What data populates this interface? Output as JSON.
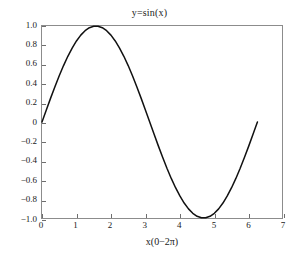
{
  "chart_data": {
    "type": "line",
    "title": "y=sin(x)",
    "xlabel": "x(0−2π)",
    "ylabel": "",
    "xlim": [
      0,
      7
    ],
    "ylim": [
      -1.0,
      1.0
    ],
    "grid": false,
    "legend": false,
    "line_color": "#111111",
    "frame_color": "#8c8c8c",
    "xticks": [
      0,
      1,
      2,
      3,
      4,
      5,
      6,
      7
    ],
    "xtick_labels": [
      "0",
      "1",
      "2",
      "3",
      "4",
      "5",
      "6",
      "7"
    ],
    "yticks": [
      1.0,
      0.8,
      0.6,
      0.4,
      0.2,
      0,
      -0.2,
      -0.4,
      -0.6,
      -0.8,
      -1.0
    ],
    "ytick_labels": [
      "1.0",
      "0.8",
      "0.6",
      "0.4",
      "0.2",
      "0",
      "−0.2",
      "−0.4",
      "−0.6",
      "−0.8",
      "−1.0"
    ],
    "series": [
      {
        "name": "sin(x)",
        "x": [
          0.0,
          0.1257,
          0.2513,
          0.377,
          0.5027,
          0.6283,
          0.754,
          0.8796,
          1.0053,
          1.131,
          1.2566,
          1.3823,
          1.508,
          1.6336,
          1.7593,
          1.885,
          2.0106,
          2.1363,
          2.2619,
          2.3876,
          2.5133,
          2.6389,
          2.7646,
          2.8903,
          3.0159,
          3.1416,
          3.2673,
          3.3929,
          3.5186,
          3.6442,
          3.7699,
          3.8956,
          4.0212,
          4.1469,
          4.2726,
          4.3982,
          4.5239,
          4.6496,
          4.7752,
          4.9009,
          5.0265,
          5.1522,
          5.2779,
          5.4035,
          5.5292,
          5.6549,
          5.7805,
          5.9062,
          6.0319,
          6.1575,
          6.2832
        ],
        "y": [
          0.0,
          0.1253,
          0.2487,
          0.3681,
          0.4818,
          0.5878,
          0.6845,
          0.7705,
          0.8443,
          0.9048,
          0.9511,
          0.9823,
          0.998,
          0.998,
          0.9823,
          0.9511,
          0.9048,
          0.8443,
          0.7705,
          0.6845,
          0.5878,
          0.4818,
          0.3681,
          0.2487,
          0.1253,
          0.0,
          -0.1253,
          -0.2487,
          -0.3681,
          -0.4818,
          -0.5878,
          -0.6845,
          -0.7705,
          -0.8443,
          -0.9048,
          -0.9511,
          -0.9823,
          -0.998,
          -0.998,
          -0.9823,
          -0.9511,
          -0.9048,
          -0.8443,
          -0.7705,
          -0.6845,
          -0.5878,
          -0.4818,
          -0.3681,
          -0.2487,
          -0.1253,
          0.0
        ]
      }
    ]
  }
}
